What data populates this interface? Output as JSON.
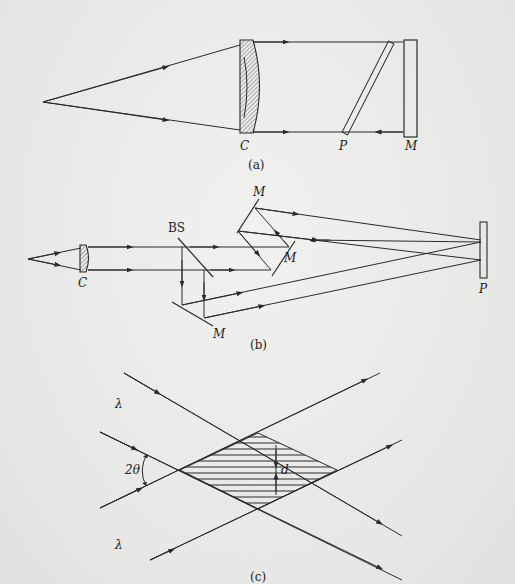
{
  "figure_a": {
    "caption": "(a)",
    "labels": {
      "lens": "C",
      "plate": "P",
      "mirror": "M"
    }
  },
  "figure_b": {
    "caption": "(b)",
    "labels": {
      "lens": "C",
      "beamsplitter": "BS",
      "mirror_top": "M",
      "mirror_right": "M",
      "mirror_bottom": "M",
      "plate": "P"
    }
  },
  "figure_c": {
    "caption": "(c)",
    "labels": {
      "wavelength_top": "λ",
      "wavelength_bottom": "λ",
      "angle": "2θ",
      "spacing": "d"
    }
  },
  "colors": {
    "ink": "#2a2a2a",
    "paper": "#ececec"
  }
}
